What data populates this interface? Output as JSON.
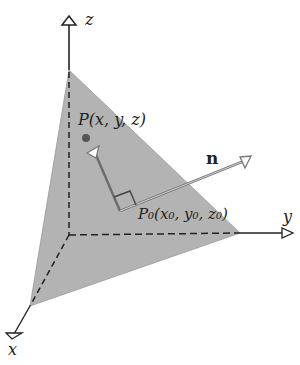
{
  "diagram": {
    "axes": {
      "x_label": "x",
      "y_label": "y",
      "z_label": "z"
    },
    "point_p": {
      "label": "P(x, y, z)"
    },
    "point_p0": {
      "label": "P₀(x₀, y₀, z₀)"
    },
    "normal_vector": {
      "label": "n"
    },
    "colors": {
      "plane": "#b0b0b0",
      "axis": "#222222",
      "vector": "#6e6e6e",
      "point": "#555555"
    }
  }
}
